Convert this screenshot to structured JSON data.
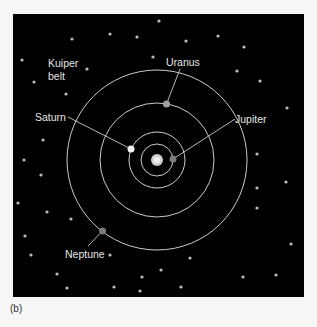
{
  "figure": {
    "caption": "(b)",
    "panel": {
      "x": 13,
      "y": 14,
      "width": 291,
      "height": 283,
      "color": "#000000"
    },
    "sun": {
      "cx": 157,
      "cy": 160,
      "r": 6,
      "color": "#cfcfcf",
      "core_color": "#eeeeee"
    },
    "orbit_color": "#cccccc",
    "orbits": [
      {
        "name": "Jupiter orbit",
        "r": 16
      },
      {
        "name": "Saturn orbit",
        "r": 28
      },
      {
        "name": "Uranus orbit",
        "r": 57
      },
      {
        "name": "Neptune orbit",
        "r": 90
      }
    ],
    "planets": [
      {
        "name": "Jupiter",
        "cx": 173,
        "cy": 159,
        "r": 3.5,
        "color": "#7a7a7a",
        "label": "Jupiter",
        "label_x": 235,
        "label_y": 123,
        "anchor": "start",
        "leader": [
          235,
          119,
          173,
          159
        ]
      },
      {
        "name": "Saturn",
        "cx": 131,
        "cy": 149,
        "r": 3.5,
        "color": "#f2f2f2",
        "label": "Saturn",
        "label_x": 35,
        "label_y": 121,
        "anchor": "start",
        "leader": [
          68,
          117,
          131,
          149
        ]
      },
      {
        "name": "Uranus",
        "cx": 166.5,
        "cy": 104,
        "r": 3.5,
        "color": "#a0a0a0",
        "label": "Uranus",
        "label_x": 166,
        "label_y": 66,
        "anchor": "start",
        "leader": [
          180,
          69,
          166.5,
          104
        ]
      },
      {
        "name": "Neptune",
        "cx": 102.5,
        "cy": 231,
        "r": 3.5,
        "color": "#7a7a7a",
        "label": "Neptune",
        "label_x": 65,
        "label_y": 258,
        "anchor": "start",
        "leader": [
          88,
          246,
          102.5,
          231
        ]
      }
    ],
    "kuiper_label": {
      "line1": "Kuiper",
      "line2": "belt",
      "x": 48,
      "y1": 67,
      "y2": 80
    },
    "label_color": "#e6e6e6",
    "star_color": "#bdbdbd",
    "stars": [
      [
        72,
        39
      ],
      [
        110,
        34
      ],
      [
        137,
        37
      ],
      [
        159,
        21
      ],
      [
        153,
        57
      ],
      [
        22,
        60
      ],
      [
        87,
        69
      ],
      [
        34,
        82
      ],
      [
        66,
        94
      ],
      [
        186,
        41
      ],
      [
        218,
        36
      ],
      [
        244,
        47
      ],
      [
        237,
        71
      ],
      [
        260,
        81
      ],
      [
        287,
        108
      ],
      [
        257,
        154
      ],
      [
        286,
        182
      ],
      [
        257,
        188
      ],
      [
        257,
        208
      ],
      [
        291,
        244
      ],
      [
        243,
        277
      ],
      [
        276,
        275
      ],
      [
        43,
        140
      ],
      [
        24,
        160
      ],
      [
        41,
        175
      ],
      [
        18,
        203
      ],
      [
        47,
        212
      ],
      [
        71,
        219
      ],
      [
        25,
        236
      ],
      [
        31,
        255
      ],
      [
        57,
        274
      ],
      [
        67,
        288
      ],
      [
        110,
        255
      ],
      [
        190,
        258
      ],
      [
        161,
        270
      ],
      [
        142,
        277
      ],
      [
        114,
        287
      ],
      [
        140,
        291
      ],
      [
        181,
        287
      ]
    ]
  }
}
